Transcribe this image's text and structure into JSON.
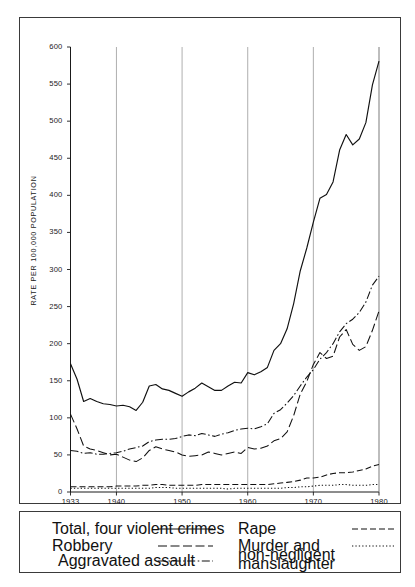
{
  "figure": {
    "y_axis_title": "RATE PER 100,000 POPULATION"
  },
  "legend": {
    "entries": [
      {
        "label": "Total, four violent crimes",
        "style": "solid"
      },
      {
        "label": "Robbery",
        "style": "long-dash"
      },
      {
        "label": "Aggravated assault",
        "style": "dash-dot"
      },
      {
        "label": "Rape",
        "style": "dashed"
      },
      {
        "label": "Murder and non-negligent manslaughter",
        "style": "dotted"
      }
    ]
  },
  "chart_data": {
    "type": "line",
    "title": "",
    "xlabel": "",
    "ylabel": "RATE PER 100,000 POPULATION",
    "xlim": [
      1933,
      1980
    ],
    "ylim": [
      0,
      600
    ],
    "yticks": [
      0,
      50,
      100,
      150,
      200,
      250,
      300,
      350,
      400,
      450,
      500,
      550,
      600
    ],
    "xticks": [
      1933,
      1940,
      1950,
      1960,
      1970,
      1980
    ],
    "gridlines": {
      "vertical_at": [
        1940,
        1950,
        1960,
        1970,
        1980
      ],
      "horizontal": false
    },
    "legend_position": "below-plot",
    "x": [
      1933,
      1934,
      1935,
      1936,
      1937,
      1938,
      1939,
      1940,
      1941,
      1942,
      1943,
      1944,
      1945,
      1946,
      1947,
      1948,
      1949,
      1950,
      1951,
      1952,
      1953,
      1954,
      1955,
      1956,
      1957,
      1958,
      1959,
      1960,
      1961,
      1962,
      1963,
      1964,
      1965,
      1966,
      1967,
      1968,
      1969,
      1970,
      1971,
      1972,
      1973,
      1974,
      1975,
      1976,
      1977,
      1978,
      1979,
      1980
    ],
    "series": [
      {
        "name": "Total, four violent crimes",
        "style": "solid",
        "values": [
          173,
          152,
          122,
          126,
          122,
          119,
          118,
          116,
          117,
          115,
          110,
          121,
          143,
          145,
          139,
          137,
          133,
          129,
          135,
          140,
          147,
          142,
          137,
          137,
          143,
          148,
          147,
          161,
          158,
          162,
          168,
          191,
          200,
          220,
          254,
          298,
          329,
          364,
          396,
          401,
          418,
          461,
          482,
          468,
          476,
          498,
          549,
          581
        ]
      },
      {
        "name": "Robbery",
        "style": "long-dash",
        "values": [
          105,
          85,
          62,
          58,
          56,
          53,
          50,
          51,
          47,
          43,
          41,
          46,
          56,
          61,
          58,
          56,
          54,
          50,
          48,
          49,
          50,
          54,
          52,
          50,
          52,
          54,
          52,
          60,
          58,
          59,
          62,
          69,
          72,
          81,
          103,
          132,
          149,
          172,
          188,
          180,
          183,
          209,
          219,
          199,
          191,
          196,
          218,
          244
        ]
      },
      {
        "name": "Aggravated assault",
        "style": "dash-dot",
        "values": [
          56,
          55,
          52,
          53,
          51,
          51,
          52,
          53,
          55,
          58,
          60,
          62,
          68,
          70,
          71,
          71,
          72,
          75,
          77,
          76,
          79,
          77,
          75,
          78,
          80,
          83,
          85,
          86,
          85,
          88,
          92,
          106,
          111,
          120,
          130,
          143,
          155,
          165,
          179,
          188,
          200,
          216,
          227,
          233,
          242,
          256,
          279,
          291
        ]
      },
      {
        "name": "Rape",
        "style": "dashed",
        "values": [
          7,
          7,
          7,
          7,
          7,
          7,
          7,
          8,
          8,
          8,
          8,
          9,
          9,
          10,
          10,
          9,
          9,
          9,
          9,
          9,
          10,
          10,
          10,
          10,
          10,
          10,
          10,
          10,
          10,
          10,
          10,
          11,
          12,
          13,
          14,
          16,
          19,
          19,
          20,
          23,
          25,
          26,
          26,
          27,
          29,
          31,
          35,
          37
        ]
      },
      {
        "name": "Murder and non-negligent manslaughter",
        "style": "dotted",
        "values": [
          5,
          5,
          5,
          5,
          5,
          5,
          5,
          5,
          5,
          5,
          5,
          5,
          5,
          6,
          6,
          6,
          5,
          5,
          5,
          5,
          5,
          5,
          5,
          5,
          4,
          5,
          5,
          5,
          5,
          5,
          5,
          5,
          5,
          6,
          6,
          7,
          7,
          8,
          9,
          9,
          9,
          10,
          10,
          9,
          9,
          9,
          10,
          10
        ]
      }
    ]
  }
}
